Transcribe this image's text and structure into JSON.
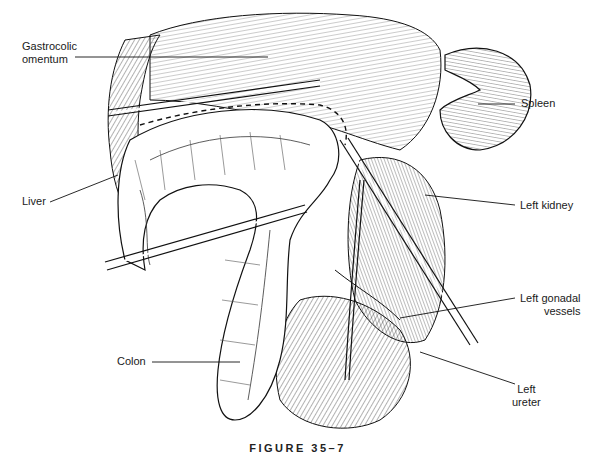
{
  "figure": {
    "caption": "FIGURE 35–7",
    "labels": {
      "gastrocolic_omentum": "Gastrocolic\nomentum",
      "spleen": "Spleen",
      "liver": "Liver",
      "left_kidney": "Left kidney",
      "left_gonadal_vessels": "Left gonadal\nvessels",
      "colon": "Colon",
      "left_ureter": "Left\nureter"
    },
    "colors": {
      "ink": "#1a1a1a",
      "background": "#ffffff"
    }
  }
}
